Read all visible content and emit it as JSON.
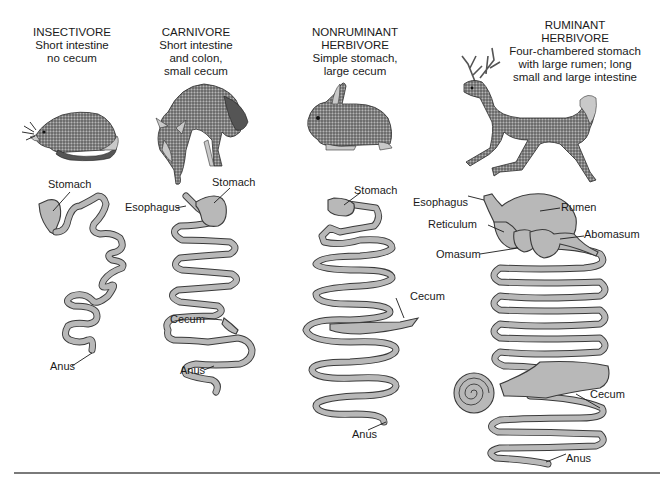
{
  "figure": {
    "columns": [
      {
        "id": "insectivore",
        "title": "INSECTIVORE",
        "description_lines": [
          "Short intestine",
          "no cecum"
        ],
        "animal": "shrew-like insectivore",
        "labels": {
          "stomach": "Stomach",
          "anus": "Anus"
        }
      },
      {
        "id": "carnivore",
        "title": "CARNIVORE",
        "description_lines": [
          "Short intestine",
          "and colon,",
          "small cecum"
        ],
        "animal": "coyote",
        "labels": {
          "stomach": "Stomach",
          "esophagus": "Esophagus",
          "cecum": "Cecum",
          "anus": "Anus"
        }
      },
      {
        "id": "nonruminant-herbivore",
        "title_lines": [
          "NONRUMINANT",
          "HERBIVORE"
        ],
        "description_lines": [
          "Simple stomach,",
          "large cecum"
        ],
        "animal": "rabbit",
        "labels": {
          "stomach": "Stomach",
          "cecum": "Cecum",
          "anus": "Anus"
        }
      },
      {
        "id": "ruminant-herbivore",
        "title_lines": [
          "RUMINANT",
          "HERBIVORE"
        ],
        "description_lines": [
          "Four-chambered stomach",
          "with large rumen; long",
          "small and large intestine"
        ],
        "animal": "deer",
        "labels": {
          "esophagus": "Esophagus",
          "rumen": "Rumen",
          "reticulum": "Reticulum",
          "abomasum": "Abomasum",
          "omasum": "Omasum",
          "cecum": "Cecum",
          "anus": "Anus"
        }
      }
    ],
    "colors": {
      "gut_fill": "#b8b8b8",
      "gut_outline": "#3a3a3a",
      "text": "#1a1a1a",
      "rule": "#7a7a7a",
      "background": "#ffffff"
    }
  }
}
